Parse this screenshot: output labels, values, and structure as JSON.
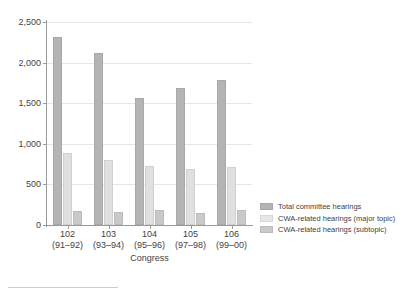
{
  "chart_data": {
    "type": "bar",
    "title": "",
    "xlabel": "Congress",
    "ylabel": "",
    "categories": [
      "102",
      "103",
      "104",
      "105",
      "106"
    ],
    "category_sublabels": [
      "(91–92)",
      "(93–94)",
      "(95–96)",
      "(97–98)",
      "(99–00)"
    ],
    "ylim": [
      0,
      2500
    ],
    "yticks": [
      0,
      500,
      1000,
      1500,
      2000,
      2500
    ],
    "ytick_labels": [
      "0",
      "500",
      "1,000",
      "1,500",
      "2,000",
      "2,500"
    ],
    "grid": true,
    "legend_position": "right",
    "series": [
      {
        "name": "Total committee hearings",
        "color": "#b4b4b4",
        "values": [
          2320,
          2120,
          1570,
          1690,
          1780
        ]
      },
      {
        "name": "CWA-related hearings (major topic)",
        "color": "#e0e0e0",
        "values": [
          890,
          800,
          730,
          690,
          720
        ]
      },
      {
        "name": "CWA-related hearings (subtopic)",
        "color": "#c9c9c9",
        "values": [
          170,
          160,
          185,
          145,
          190
        ]
      }
    ]
  },
  "axis": {
    "x_title": "Congress"
  }
}
